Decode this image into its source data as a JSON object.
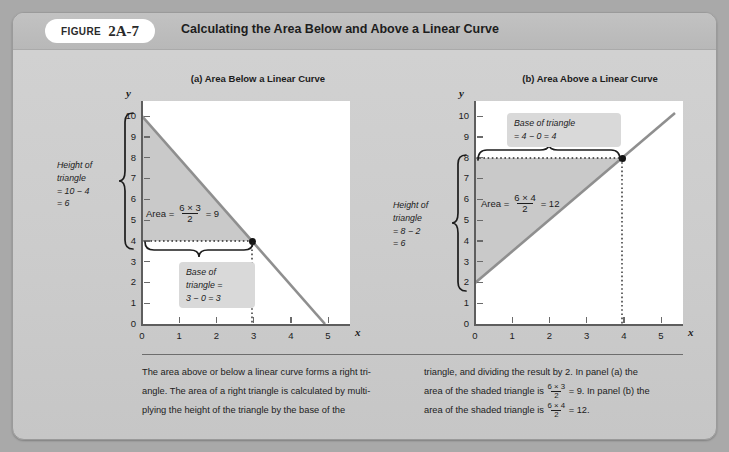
{
  "figure": {
    "label_word": "Figure",
    "number": "2A-7",
    "title": "Calculating the Area Below and Above a Linear Curve"
  },
  "panel_a": {
    "title": "(a) Area Below a Linear Curve",
    "y_axis_label": "y",
    "x_axis_label": "x",
    "y_ticks": [
      "10",
      "9",
      "8",
      "7",
      "6",
      "5",
      "4",
      "3",
      "2",
      "1",
      "0"
    ],
    "x_ticks": [
      "0",
      "1",
      "2",
      "3",
      "4",
      "5"
    ],
    "area_label_prefix": "Area =",
    "area_numerator": "6 × 3",
    "area_denominator": "2",
    "area_result": "= 9",
    "height_note": "Height of triangle = 10 − 4 = 6",
    "height_note_lines": [
      "Height of",
      "triangle",
      "= 10 − 4",
      "= 6"
    ],
    "base_note_lines": [
      "Base of",
      "triangle =",
      "3 − 0 = 3"
    ]
  },
  "panel_b": {
    "title": "(b) Area Above a Linear Curve",
    "y_axis_label": "y",
    "x_axis_label": "x",
    "y_ticks": [
      "10",
      "9",
      "8",
      "7",
      "6",
      "5",
      "4",
      "3",
      "2",
      "1",
      "0"
    ],
    "x_ticks": [
      "0",
      "1",
      "2",
      "3",
      "4",
      "5"
    ],
    "area_label_prefix": "Area =",
    "area_numerator": "6 × 4",
    "area_denominator": "2",
    "area_result": "= 12",
    "height_note_lines": [
      "Height of",
      "triangle",
      "= 8 − 2",
      "= 6"
    ],
    "base_note_lines": [
      "Base of triangle",
      "= 4 − 0 = 4"
    ]
  },
  "caption": {
    "left_part1": "The area above or below a linear curve forms a right tri-",
    "left_part2": "angle. The area of a right triangle is calculated by multi-",
    "left_part3": "plying the height of the triangle by the base of the",
    "right_part1": "triangle, and dividing the result by 2. In panel (a) the",
    "right_part2a": "area of the shaded triangle is",
    "right_frac1_num": "6 × 3",
    "right_frac1_den": "2",
    "right_part2b": "= 9. In panel (b) the",
    "right_part3a": "area of the shaded triangle is",
    "right_frac2_num": "6 × 4",
    "right_frac2_den": "2",
    "right_part3b": "= 12."
  },
  "chart_data": [
    {
      "type": "area",
      "title": "(a) Area Below a Linear Curve",
      "xlabel": "x",
      "ylabel": "y",
      "xlim": [
        0,
        5.6
      ],
      "ylim": [
        0,
        10.4
      ],
      "xticks": [
        0,
        1,
        2,
        3,
        4,
        5
      ],
      "yticks": [
        0,
        1,
        2,
        3,
        4,
        5,
        6,
        7,
        8,
        9,
        10
      ],
      "grid": false,
      "line": {
        "points": [
          [
            0,
            10
          ],
          [
            5,
            0
          ]
        ],
        "slope": -2,
        "intercept": 10,
        "color": "#8c8c8c"
      },
      "shaded_region": {
        "vertices": [
          [
            0,
            10
          ],
          [
            3,
            4
          ],
          [
            0,
            4
          ]
        ],
        "color": "#c9c9c9",
        "area": 9
      },
      "marker_points": [
        [
          3,
          4
        ]
      ],
      "annotations": [
        "Area = (6 × 3)/2 = 9",
        "Height of triangle = 10 − 4 = 6",
        "Base of triangle = 3 − 0 = 3"
      ]
    },
    {
      "type": "area",
      "title": "(b) Area Above a Linear Curve",
      "xlabel": "x",
      "ylabel": "y",
      "xlim": [
        0,
        5.6
      ],
      "ylim": [
        0,
        10.4
      ],
      "xticks": [
        0,
        1,
        2,
        3,
        4,
        5
      ],
      "yticks": [
        0,
        1,
        2,
        3,
        4,
        5,
        6,
        7,
        8,
        9,
        10
      ],
      "grid": false,
      "line": {
        "points": [
          [
            0,
            2
          ],
          [
            5.4,
            9.5
          ]
        ],
        "slope": 1.5,
        "intercept": 2,
        "color": "#8c8c8c"
      },
      "shaded_region": {
        "vertices": [
          [
            0,
            2
          ],
          [
            0,
            8
          ],
          [
            4,
            8
          ]
        ],
        "color": "#c9c9c9",
        "area": 12
      },
      "marker_points": [
        [
          4,
          8
        ]
      ],
      "annotations": [
        "Area = (6 × 4)/2 = 12",
        "Height of triangle = 8 − 2 = 6",
        "Base of triangle = 4 − 0 = 4"
      ]
    }
  ]
}
